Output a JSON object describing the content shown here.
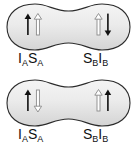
{
  "figure": {
    "background_color": "#ffffff",
    "outline_color": "#2b2b2b",
    "fill_light": "#f2f2f2",
    "fill_mid": "#d8d8d8",
    "filled_arrow_color": "#111111",
    "hollow_arrow_stroke": "#7a7a7a",
    "hollow_arrow_fill": "#ffffff"
  },
  "panels": [
    {
      "id": "top",
      "shape_name": "peanut-lobe-shape",
      "spins": {
        "left": [
          {
            "name": "spin-arrow-I-A",
            "direction": "up",
            "style": "filled"
          },
          {
            "name": "spin-arrow-S-A",
            "direction": "up",
            "style": "hollow"
          }
        ],
        "right": [
          {
            "name": "spin-arrow-S-B",
            "direction": "up",
            "style": "hollow"
          },
          {
            "name": "spin-arrow-I-B",
            "direction": "down",
            "style": "filled"
          }
        ]
      },
      "labels": {
        "left": {
          "parts": [
            {
              "base": "I",
              "sub": "A"
            },
            {
              "base": "S",
              "sub": "A"
            }
          ]
        },
        "right": {
          "parts": [
            {
              "base": "S",
              "sub": "B"
            },
            {
              "base": "I",
              "sub": "B"
            }
          ]
        }
      }
    },
    {
      "id": "bottom",
      "shape_name": "peanut-lobe-shape",
      "spins": {
        "left": [
          {
            "name": "spin-arrow-I-A",
            "direction": "up",
            "style": "filled"
          },
          {
            "name": "spin-arrow-S-A",
            "direction": "down",
            "style": "hollow"
          }
        ],
        "right": [
          {
            "name": "spin-arrow-S-B",
            "direction": "up",
            "style": "hollow"
          },
          {
            "name": "spin-arrow-I-B",
            "direction": "up",
            "style": "filled"
          }
        ]
      },
      "labels": {
        "left": {
          "parts": [
            {
              "base": "I",
              "sub": "A"
            },
            {
              "base": "S",
              "sub": "A"
            }
          ]
        },
        "right": {
          "parts": [
            {
              "base": "S",
              "sub": "B"
            },
            {
              "base": "I",
              "sub": "B"
            }
          ]
        }
      }
    }
  ],
  "text": {
    "top_left_label_base1": "I",
    "top_left_label_sub1": "A",
    "top_left_label_base2": "S",
    "top_left_label_sub2": "A",
    "top_right_label_base1": "S",
    "top_right_label_sub1": "B",
    "top_right_label_base2": "I",
    "top_right_label_sub2": "B",
    "bottom_left_label_base1": "I",
    "bottom_left_label_sub1": "A",
    "bottom_left_label_base2": "S",
    "bottom_left_label_sub2": "A",
    "bottom_right_label_base1": "S",
    "bottom_right_label_sub1": "B",
    "bottom_right_label_base2": "I",
    "bottom_right_label_sub2": "B"
  }
}
